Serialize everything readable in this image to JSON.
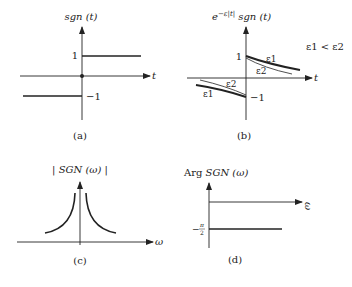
{
  "panels": {
    "a": {
      "title": "sgn (t)",
      "x_axis_label": "t",
      "tick_pos": "1",
      "tick_neg": "−1",
      "caption": "(a)"
    },
    "b": {
      "title_prefix": "e",
      "title_exponent": "−ε|t|",
      "title_suffix": " sgn (t)",
      "x_axis_label": "t",
      "tick_pos": "1",
      "tick_neg": "−1",
      "curve_label_e1_upper": "ε1",
      "curve_label_e2_upper": "ε2",
      "curve_label_e2_lower": "ε2",
      "curve_label_e1_lower": "ε1",
      "condition": "ε1 < ε2",
      "caption": "(b)"
    },
    "c": {
      "title": "| SGN (ω) |",
      "x_axis_label": "ω",
      "caption": "(c)"
    },
    "d": {
      "title_prefix": "Arg ",
      "title_main": "SGN (ω)",
      "x_axis_label": "ω",
      "tick_label_num": "π",
      "tick_label_den": "2",
      "tick_label_sign": "−",
      "caption": "(d)"
    }
  },
  "colors": {
    "ink": "#222222",
    "background": "#ffffff"
  }
}
